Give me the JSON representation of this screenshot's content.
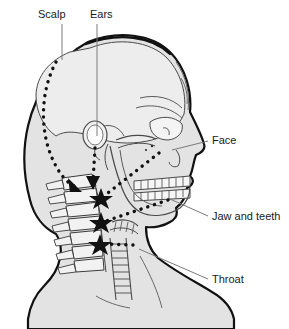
{
  "figure": {
    "background_color": "#ffffff",
    "outline_color": "#111111",
    "skin_fill": "#e3e3e3",
    "cranium_fill": "#ededed",
    "bone_fill": "#f4f4f4",
    "bone_line_color": "#555555",
    "pathway_color": "#111111",
    "leader_color": "#7a7a7a"
  },
  "labels": [
    {
      "id": "scalp",
      "text": "Scalp",
      "text_x": 38,
      "text_y": 18,
      "anchor": "start",
      "leader": {
        "x1": 62,
        "y1": 24,
        "x2": 62,
        "y2": 60
      }
    },
    {
      "id": "ears",
      "text": "Ears",
      "text_x": 90,
      "text_y": 18,
      "anchor": "start",
      "leader": {
        "x1": 97,
        "y1": 24,
        "x2": 97,
        "y2": 136
      }
    },
    {
      "id": "face",
      "text": "Face",
      "text_x": 212,
      "text_y": 144,
      "anchor": "start",
      "leader": {
        "x1": 208,
        "y1": 141,
        "x2": 172,
        "y2": 150
      }
    },
    {
      "id": "jaw-and-teeth",
      "text": "Jaw and teeth",
      "text_x": 212,
      "text_y": 220,
      "anchor": "start",
      "leader": {
        "x1": 208,
        "y1": 216,
        "x2": 170,
        "y2": 199
      }
    },
    {
      "id": "throat",
      "text": "Throat",
      "text_x": 212,
      "text_y": 283,
      "anchor": "start",
      "leader": {
        "x1": 208,
        "y1": 279,
        "x2": 139,
        "y2": 249
      }
    }
  ],
  "pathways": [
    {
      "id": "scalp-pathway",
      "label": "Scalp",
      "description": "Curved dotted arc from upper posterior cranium down to upper cervical vertebrae",
      "path": "M 56 62 C 40 92, 40 130, 52 158 C 60 176, 68 183, 74 186",
      "arrow_at": {
        "x": 76,
        "y": 188,
        "angle": 42
      }
    },
    {
      "id": "ears-pathway",
      "label": "Ears",
      "description": "Short vertical dotted line from ear canal down to cervical vertebrae",
      "path": "M 95 146 L 93 182",
      "arrow_at": {
        "x": 93,
        "y": 186,
        "angle": 92
      }
    },
    {
      "id": "face-pathway",
      "label": "Face",
      "description": "Long diagonal dotted line from mid-face down and back to cervical vertebrae",
      "path": "M 159 153 L 104 196",
      "arrow_at": {
        "x": 101,
        "y": 198,
        "angle": 218
      }
    },
    {
      "id": "jaw-pathway",
      "label": "Jaw and teeth",
      "description": "Diagonal dotted line from lower jaw back to mid cervical vertebrae",
      "path": "M 168 200 L 106 221",
      "arrow_at": {
        "x": 102,
        "y": 222,
        "angle": 198
      }
    },
    {
      "id": "throat-pathway",
      "label": "Throat",
      "description": "Horizontal dotted line from trachea back to lower cervical vertebrae",
      "path": "M 133 245 L 104 244",
      "arrow_at": {
        "x": 100,
        "y": 244,
        "angle": 182
      }
    }
  ],
  "convergence_markers": [
    {
      "id": "marker-c1",
      "x": 76,
      "y": 188,
      "type": "arrowhead"
    },
    {
      "id": "marker-c2",
      "x": 93,
      "y": 186,
      "type": "arrowhead"
    },
    {
      "id": "marker-c3",
      "x": 101,
      "y": 198,
      "type": "star"
    },
    {
      "id": "marker-c4",
      "x": 101,
      "y": 222,
      "type": "star"
    },
    {
      "id": "marker-c5",
      "x": 100,
      "y": 244,
      "type": "star"
    }
  ],
  "anatomy": [
    {
      "id": "head-profile",
      "name": "lateral head and neck silhouette"
    },
    {
      "id": "cranium",
      "name": "cranium"
    },
    {
      "id": "ear-canal",
      "name": "external ear canal"
    },
    {
      "id": "orbit",
      "name": "eye socket"
    },
    {
      "id": "zygomatic-arch",
      "name": "cheekbone"
    },
    {
      "id": "maxilla-teeth",
      "name": "upper teeth"
    },
    {
      "id": "mandible-teeth",
      "name": "lower teeth"
    },
    {
      "id": "mandible",
      "name": "jawbone"
    },
    {
      "id": "cervical-spine",
      "name": "cervical vertebrae"
    },
    {
      "id": "trachea",
      "name": "trachea"
    },
    {
      "id": "hyoid",
      "name": "hyoid and larynx"
    }
  ]
}
